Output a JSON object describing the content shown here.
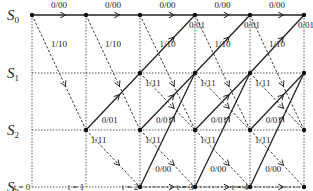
{
  "diagram": {
    "type": "trellis",
    "states": [
      {
        "id": "S0",
        "label": "S",
        "sub": "0",
        "y": 15
      },
      {
        "id": "S1",
        "label": "S",
        "sub": "1",
        "y": 73
      },
      {
        "id": "S2",
        "label": "S",
        "sub": "2",
        "y": 130
      },
      {
        "id": "S3",
        "label": "S",
        "sub": "3",
        "y": 187
      }
    ],
    "times": [
      {
        "label": "t = 0",
        "x": 32
      },
      {
        "label": "t = 1",
        "x": 86
      },
      {
        "label": "t = 2",
        "x": 140
      },
      {
        "label": "t = 3",
        "x": 195
      },
      {
        "label": "t = 4",
        "x": 250
      },
      {
        "label": "",
        "x": 304
      }
    ],
    "transitions": [
      {
        "from": 0,
        "to": 0,
        "label": "0/00",
        "style": "solid"
      },
      {
        "from": 0,
        "to": 2,
        "label": "1/10",
        "style": "dashed"
      },
      {
        "from": 1,
        "to": 0,
        "label": "0/01",
        "style": "solid"
      },
      {
        "from": 1,
        "to": 2,
        "label": "1/11",
        "style": "dashed"
      },
      {
        "from": 2,
        "to": 1,
        "label": "0/01",
        "style": "solid"
      },
      {
        "from": 2,
        "to": 3,
        "label": "1/11",
        "style": "dashed"
      },
      {
        "from": 3,
        "to": 1,
        "label": "0/00",
        "style": "solid"
      },
      {
        "from": 3,
        "to": 3,
        "label": "1/10",
        "style": "dashed"
      }
    ],
    "reachable": [
      [
        0
      ],
      [
        0,
        2
      ],
      [
        0,
        1,
        2,
        3
      ],
      [
        0,
        1,
        2,
        3
      ],
      [
        0,
        1,
        2,
        3
      ]
    ],
    "colors": {
      "line": "#222222",
      "grid": "#333333",
      "node": "#111111"
    }
  }
}
